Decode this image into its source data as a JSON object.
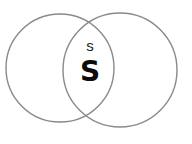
{
  "figure": {
    "type": "venn-diagram",
    "title": "",
    "background_color": "#ffffff",
    "width": 192,
    "height": 144
  },
  "style": {
    "circle_stroke_color": "#8a8a8a",
    "circle_stroke_width": 1.4,
    "circle_fill": "none",
    "small_label_color": "#1d1d1d",
    "large_label_color": "#0b0b0b"
  },
  "circles": [
    {
      "name": "left-circle",
      "cx": 60,
      "cy": 68,
      "r": 54,
      "label": ""
    },
    {
      "name": "right-circle",
      "cx": 120,
      "cy": 70,
      "r": 57,
      "label": ""
    }
  ],
  "intersection_points": [
    {
      "x": 88,
      "y": 15
    },
    {
      "x": 88,
      "y": 118
    }
  ],
  "labels": {
    "intersection_small": "s",
    "intersection_large": "S"
  },
  "chart_data": {
    "type": "venn",
    "title": "",
    "sets": [
      "left-circle",
      "right-circle"
    ],
    "regions": [
      {
        "region": "left-only",
        "label": ""
      },
      {
        "region": "right-only",
        "label": ""
      },
      {
        "region": "intersection",
        "label": "s\nS"
      }
    ],
    "annotations": [
      {
        "text": "s",
        "x": 90,
        "y": 46,
        "size": "small",
        "weight": "regular"
      },
      {
        "text": "S",
        "x": 90,
        "y": 71,
        "size": "large",
        "weight": "bold"
      }
    ],
    "legend": null,
    "grid": false
  }
}
